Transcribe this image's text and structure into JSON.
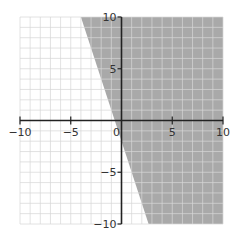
{
  "chart_data": {
    "type": "area",
    "title": "",
    "xlabel": "",
    "ylabel": "",
    "xlim": [
      -10,
      10
    ],
    "ylim": [
      -10,
      10
    ],
    "grid": true,
    "grid_step": 1,
    "x_ticks": [
      -10,
      -5,
      0,
      5,
      10
    ],
    "y_ticks": [
      -10,
      -5,
      5,
      10
    ],
    "x_tick_labels": [
      "−10",
      "−5",
      "0",
      "5",
      "10"
    ],
    "y_tick_labels": [
      "−10",
      "−5",
      "5",
      "10"
    ],
    "boundary_line": {
      "equation": "y = -3x - 2",
      "slope": -3,
      "intercept": -2,
      "style": "solid"
    },
    "inequality": "y ≥ -3x - 2",
    "shaded_region": "right of boundary line",
    "shaded_polygon": [
      [
        -4,
        10
      ],
      [
        10,
        10
      ],
      [
        10,
        -10
      ],
      [
        2.67,
        -10
      ]
    ],
    "legend": null
  },
  "colors": {
    "shade": "#a9a9a9",
    "grid": "#d6d6d6",
    "axis": "#222222",
    "background": "#ffffff"
  }
}
